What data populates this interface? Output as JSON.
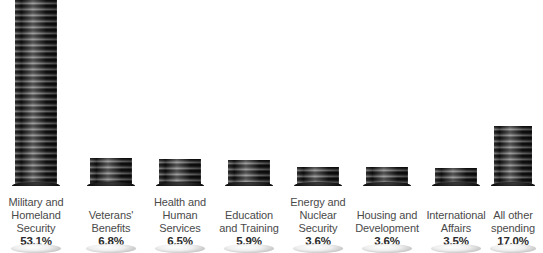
{
  "chart_data": {
    "type": "bar",
    "title": "",
    "subtitle": "",
    "xlabel": "",
    "ylabel": "",
    "units": "percent of discretionary federal spending",
    "grid": false,
    "legend": "none",
    "style": "pictorial stacked-coin columns, grayscale",
    "categories": [
      "Military and Homeland Security",
      "Veterans' Benefits",
      "Health and Human Services",
      "Education and Training",
      "Energy and Nuclear Security",
      "Housing and Development",
      "International Affairs",
      "All other spending"
    ],
    "values": [
      53.1,
      6.8,
      6.5,
      5.9,
      3.6,
      3.6,
      3.5,
      17.0
    ],
    "value_labels": [
      "53.1%",
      "6.8%",
      "6.5%",
      "5.9%",
      "3.6%",
      "3.6%",
      "3.5%",
      "17.0%"
    ],
    "ylim": [
      0,
      53.1
    ]
  },
  "colors": {
    "background": "#ffffff",
    "label_text": "#4a4a4a",
    "value_text": "#2b2b2b",
    "coin_dark": "#0d0d0d",
    "coin_mid": "#5a5a5a",
    "coin_light": "#8d8d8d",
    "coin_top_face": "#efefef"
  },
  "columns": [
    {
      "name": "military-and-homeland-security",
      "lines": [
        "Military and",
        "Homeland",
        "Security"
      ],
      "percent": "53.1%",
      "value": 53.1,
      "left": 1,
      "stack_height": 186,
      "stack_width": 52
    },
    {
      "name": "veterans-benefits",
      "lines": [
        "Veterans'",
        "Benefits"
      ],
      "percent": "6.8%",
      "value": 6.8,
      "left": 76,
      "stack_height": 28,
      "stack_width": 52
    },
    {
      "name": "health-and-human-services",
      "lines": [
        "Health and",
        "Human",
        "Services"
      ],
      "percent": "6.5%",
      "value": 6.5,
      "left": 145,
      "stack_height": 27,
      "stack_width": 52
    },
    {
      "name": "education-and-training",
      "lines": [
        "Education",
        "and Training"
      ],
      "percent": "5.9%",
      "value": 5.9,
      "left": 214,
      "stack_height": 26,
      "stack_width": 52
    },
    {
      "name": "energy-and-nuclear-security",
      "lines": [
        "Energy and",
        "Nuclear",
        "Security"
      ],
      "percent": "3.6%",
      "value": 3.6,
      "left": 283,
      "stack_height": 19,
      "stack_width": 52
    },
    {
      "name": "housing-and-development",
      "lines": [
        "Housing and",
        "Development"
      ],
      "percent": "3.6%",
      "value": 3.6,
      "left": 352,
      "stack_height": 19,
      "stack_width": 52
    },
    {
      "name": "international-affairs",
      "lines": [
        "International",
        "Affairs"
      ],
      "percent": "3.5%",
      "value": 3.5,
      "left": 421,
      "stack_height": 18,
      "stack_width": 52
    },
    {
      "name": "all-other-spending",
      "lines": [
        "All other",
        "spending"
      ],
      "percent": "17.0%",
      "value": 17.0,
      "left": 478,
      "stack_height": 60,
      "stack_width": 48
    }
  ]
}
